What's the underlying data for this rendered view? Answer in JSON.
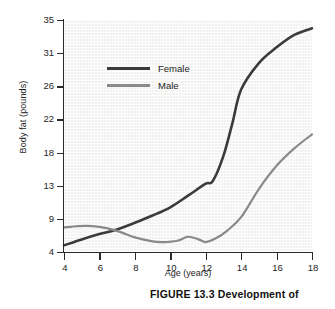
{
  "figure": {
    "caption": "FIGURE 13.3  Development of"
  },
  "chart_data": {
    "type": "line",
    "title": "",
    "xlabel": "Age (years)",
    "ylabel": "Body fat (pounds)",
    "xlim": [
      4,
      18
    ],
    "ylim": [
      4,
      35
    ],
    "xticks": [
      4,
      6,
      8,
      10,
      12,
      14,
      16,
      18
    ],
    "yticks": [
      4,
      9,
      13,
      18,
      22,
      26,
      31,
      35
    ],
    "ytick_labels": [
      "4",
      "9",
      "13",
      "18",
      "22",
      "26",
      "31",
      "35"
    ],
    "xtick_labels": [
      "4",
      "6",
      "8",
      "10",
      "12",
      "14",
      "16",
      "18"
    ],
    "y_scale": "nonlinear-even-spacing",
    "grid": false,
    "plot_background": "#f2f2f0",
    "legend_position": "upper-left-inside",
    "series": [
      {
        "name": "Female",
        "color": "#3b3b3b",
        "width": 2.6,
        "x": [
          4,
          5,
          6,
          7,
          8,
          9,
          10,
          11,
          12,
          12.4,
          13,
          13.5,
          14,
          15,
          16,
          17,
          18
        ],
        "values": [
          5.0,
          5.9,
          6.7,
          7.4,
          8.4,
          9.4,
          10.4,
          11.8,
          13.3,
          13.7,
          17.5,
          21.5,
          25.6,
          29.5,
          31.7,
          33.2,
          34.0
        ]
      },
      {
        "name": "Male",
        "color": "#8a8a8a",
        "width": 2.2,
        "x": [
          4,
          4.8,
          5.6,
          6.4,
          7.2,
          8,
          9,
          9.6,
          10.4,
          11,
          11.6,
          12,
          12.6,
          13.2,
          14,
          15,
          16,
          17,
          18
        ],
        "values": [
          7.7,
          7.9,
          7.9,
          7.6,
          7.0,
          6.2,
          5.6,
          5.5,
          5.7,
          6.3,
          5.9,
          5.5,
          6.1,
          7.2,
          9.2,
          12.6,
          16.0,
          18.5,
          20.2
        ]
      }
    ]
  },
  "legend": {
    "items": [
      {
        "label": "Female",
        "color": "#3b3b3b"
      },
      {
        "label": "Male",
        "color": "#8a8a8a"
      }
    ]
  }
}
